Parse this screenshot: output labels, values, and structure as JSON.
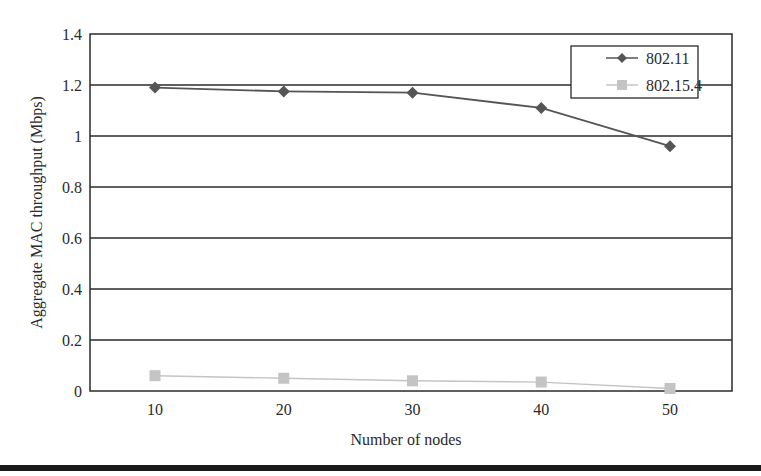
{
  "chart_data": {
    "type": "line",
    "title": "",
    "xlabel": "Number of nodes",
    "ylabel": "Aggregate MAC throughput (Mbps)",
    "x": [
      10,
      20,
      30,
      40,
      50
    ],
    "categories": [
      "10",
      "20",
      "30",
      "40",
      "50"
    ],
    "ylim": [
      0,
      1.4
    ],
    "yticks": [
      "0",
      "0.2",
      "0.4",
      "0.6",
      "0.8",
      "1",
      "1.2",
      "1.4"
    ],
    "grid": "horizontal",
    "legend_position": "top-right (inside)",
    "series": [
      {
        "name": "802.11",
        "marker": "diamond",
        "color": "#555555",
        "values": [
          1.19,
          1.175,
          1.17,
          1.11,
          0.96
        ]
      },
      {
        "name": "802.15.4",
        "marker": "square",
        "color": "#c4c4c4",
        "values": [
          0.06,
          0.05,
          0.04,
          0.035,
          0.01
        ]
      }
    ]
  }
}
